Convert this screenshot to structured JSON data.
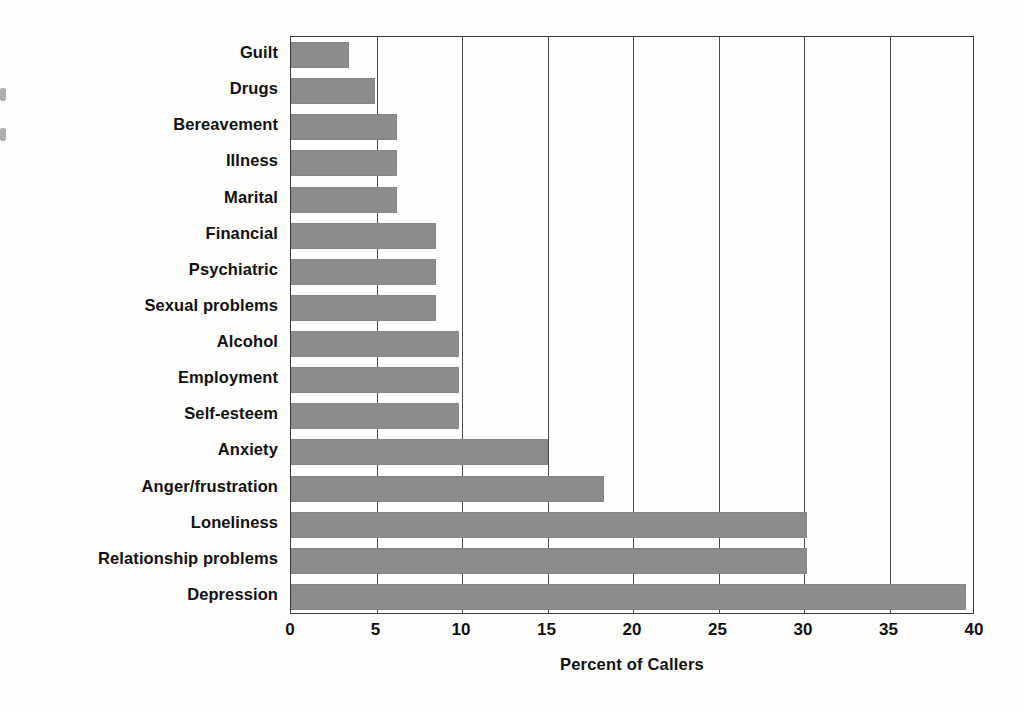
{
  "figure": {
    "background_color": "#fdfdfc",
    "plot_border_color": "#3b3b3b",
    "bar_color": "#8c8c8c",
    "gridline_color": "#4a4a4a"
  },
  "chart_data": {
    "type": "bar",
    "orientation": "horizontal",
    "title": "",
    "xlabel": "Percent of Callers",
    "ylabel": "",
    "xlim": [
      0,
      40
    ],
    "xticks": [
      0,
      5,
      10,
      15,
      20,
      25,
      30,
      35,
      40
    ],
    "xtick_labels": [
      "0",
      "5",
      "10",
      "15",
      "20",
      "25",
      "30",
      "35",
      "40"
    ],
    "grid": "vertical",
    "legend": "none",
    "categories": [
      "Guilt",
      "Drugs",
      "Bereavement",
      "Illness",
      "Marital",
      "Financial",
      "Psychiatric",
      "Sexual problems",
      "Alcohol",
      "Employment",
      "Self-esteem",
      "Anxiety",
      "Anger/frustration",
      "Loneliness",
      "Relationship problems",
      "Depression"
    ],
    "values": [
      3.4,
      4.9,
      6.2,
      6.2,
      6.2,
      8.5,
      8.5,
      8.5,
      9.8,
      9.8,
      9.8,
      15.0,
      18.3,
      30.2,
      30.2,
      39.5
    ],
    "series": [
      {
        "name": "Percent of Callers",
        "values": [
          3.4,
          4.9,
          6.2,
          6.2,
          6.2,
          8.5,
          8.5,
          8.5,
          9.8,
          9.8,
          9.8,
          15.0,
          18.3,
          30.2,
          30.2,
          39.5
        ]
      }
    ]
  }
}
